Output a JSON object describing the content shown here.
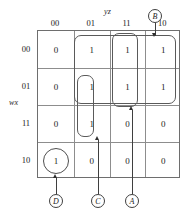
{
  "diagram": {
    "type": "karnaugh-map",
    "column_variable": "yz",
    "row_variable": "wx",
    "column_headers": [
      "00",
      "01",
      "11",
      "10"
    ],
    "row_headers": [
      "00",
      "01",
      "11",
      "10"
    ],
    "cells": [
      [
        "0",
        "1",
        "1",
        "1"
      ],
      [
        "0",
        "1",
        "1",
        "1"
      ],
      [
        "0",
        "1",
        "0",
        "0"
      ],
      [
        "1",
        "0",
        "0",
        "0"
      ]
    ],
    "groups": [
      {
        "id": "B",
        "label": "B",
        "cells": "rows 00-01, cols 01-11-10",
        "shape": "rounded-rect"
      },
      {
        "id": "A",
        "label": "A",
        "cells": "rows 00-01, col 11",
        "shape": "rounded-rect"
      },
      {
        "id": "C",
        "label": "C",
        "cells": "rows 01-11, col 01",
        "shape": "rounded-rect"
      },
      {
        "id": "D",
        "label": "D",
        "cells": "row 10, col 00",
        "shape": "circle"
      }
    ],
    "callouts": [
      {
        "id": "B",
        "label": "B",
        "position": "top"
      },
      {
        "id": "C",
        "label": "C",
        "position": "bottom"
      },
      {
        "id": "A",
        "label": "A",
        "position": "bottom"
      },
      {
        "id": "D",
        "label": "D",
        "position": "bottom"
      }
    ],
    "colors": {
      "grid_line": "#8d8d8d",
      "grid_border": "#6e6e6e",
      "group_outline": "#5a5a5a",
      "callout_outline": "#3f3f3f",
      "text": "#1a1a1a",
      "background": "#ffffff"
    }
  }
}
